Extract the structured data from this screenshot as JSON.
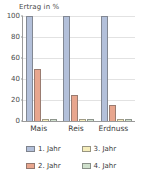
{
  "chart_data": {
    "type": "bar",
    "title": "Ertrag in %",
    "xlabel": "",
    "ylabel": "Ertrag in %",
    "categories": [
      "Mais",
      "Reis",
      "Erdnuss"
    ],
    "series": [
      {
        "name": "1. Jahr",
        "color": "#b3c0da",
        "values": [
          100,
          100,
          100
        ]
      },
      {
        "name": "2. Jahr",
        "color": "#e8a68e",
        "values": [
          50,
          25,
          15
        ]
      },
      {
        "name": "3. Jahr",
        "color": "#f5edbb",
        "values": [
          2,
          2,
          2
        ]
      },
      {
        "name": "4. Jahr",
        "color": "#cfe0cc",
        "values": [
          2,
          2,
          2
        ]
      }
    ],
    "ylim": [
      0,
      100
    ],
    "yticks": [
      0,
      20,
      40,
      60,
      80,
      100
    ],
    "ytick_labels": [
      "0",
      "20",
      "40",
      "60",
      "80",
      "100"
    ],
    "grid": true,
    "legend_position": "bottom"
  },
  "legend": {
    "items": [
      {
        "label": "1. Jahr"
      },
      {
        "label": "3. Jahr"
      },
      {
        "label": "2. Jahr"
      },
      {
        "label": "4. Jahr"
      }
    ]
  }
}
